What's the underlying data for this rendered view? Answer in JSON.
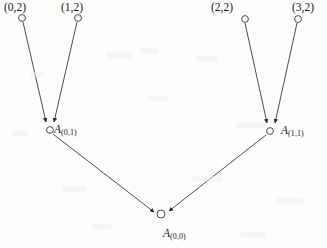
{
  "figure": {
    "type": "directed-acyclic-graph",
    "background_color": "#fdfdfd",
    "stroke_color": "#3a3a3a",
    "text_color": "#1a1a1a",
    "width": 327,
    "height": 248
  },
  "nodes": [
    {
      "id": "n02",
      "label": "(0,2)",
      "label_kind": "coord",
      "cx": 22,
      "cy": 18,
      "r": 3.4,
      "label_x": 4,
      "label_y": 2,
      "level": "top"
    },
    {
      "id": "n12",
      "label": "(1,2)",
      "label_kind": "coord",
      "cx": 78,
      "cy": 18,
      "r": 3.4,
      "label_x": 61,
      "label_y": 2,
      "level": "top"
    },
    {
      "id": "n22",
      "label": "(2,2)",
      "label_kind": "coord",
      "cx": 245,
      "cy": 19,
      "r": 3.4,
      "label_x": 211,
      "label_y": 2,
      "level": "top"
    },
    {
      "id": "n32",
      "label": "(3,2)",
      "label_kind": "coord",
      "cx": 298,
      "cy": 19,
      "r": 3.4,
      "label_x": 292,
      "label_y": 2,
      "level": "top"
    },
    {
      "id": "a01",
      "base": "A",
      "sub": "(0,1)",
      "label_kind": "avar",
      "cx": 50,
      "cy": 130,
      "r": 3.4,
      "label_x": 54,
      "label_y": 124,
      "level": "middle"
    },
    {
      "id": "a11",
      "base": "A",
      "sub": "(1,1)",
      "label_kind": "avar",
      "cx": 270,
      "cy": 131,
      "r": 3.4,
      "label_x": 281,
      "label_y": 125,
      "level": "middle"
    },
    {
      "id": "a00",
      "base": "A",
      "sub": "(0,0)",
      "label_kind": "avar",
      "cx": 161,
      "cy": 214,
      "r": 4.0,
      "label_x": 163,
      "label_y": 228,
      "level": "bottom"
    }
  ],
  "edges": [
    {
      "id": "e1",
      "from": "n02",
      "to": "a01",
      "arrowhead": true,
      "x1": 23,
      "y1": 22,
      "x2": 46,
      "y2": 122
    },
    {
      "id": "e2",
      "from": "n12",
      "to": "a01",
      "arrowhead": true,
      "x1": 77,
      "y1": 22,
      "x2": 54,
      "y2": 122
    },
    {
      "id": "e3",
      "from": "n22",
      "to": "a11",
      "arrowhead": true,
      "x1": 245,
      "y1": 23,
      "x2": 267,
      "y2": 123
    },
    {
      "id": "e4",
      "from": "n32",
      "to": "a11",
      "arrowhead": true,
      "x1": 297,
      "y1": 23,
      "x2": 275,
      "y2": 123
    },
    {
      "id": "e5",
      "from": "a01",
      "to": "a00",
      "arrowhead": true,
      "x1": 53,
      "y1": 134,
      "x2": 154,
      "y2": 212
    },
    {
      "id": "e6",
      "from": "a11",
      "to": "a00",
      "arrowhead": true,
      "x1": 266,
      "y1": 135,
      "x2": 169,
      "y2": 211
    }
  ]
}
